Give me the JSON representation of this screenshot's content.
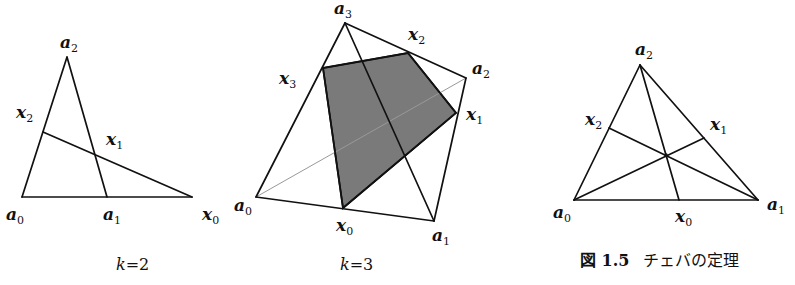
{
  "figure": {
    "number_label": "図 1.5",
    "title": "チェバの定理",
    "panels": [
      {
        "id": "k2",
        "caption_var": "k",
        "caption_eq": "=2",
        "points": {
          "a0": {
            "name": "a",
            "sub": "0"
          },
          "a1": {
            "name": "a",
            "sub": "1"
          },
          "a2": {
            "name": "a",
            "sub": "2"
          },
          "x0": {
            "name": "x",
            "sub": "0"
          },
          "x1": {
            "name": "x",
            "sub": "1"
          },
          "x2": {
            "name": "x",
            "sub": "2"
          }
        }
      },
      {
        "id": "k3",
        "caption_var": "k",
        "caption_eq": "=3",
        "points": {
          "a0": {
            "name": "a",
            "sub": "0"
          },
          "a1": {
            "name": "a",
            "sub": "1"
          },
          "a2": {
            "name": "a",
            "sub": "2"
          },
          "a3": {
            "name": "a",
            "sub": "3"
          },
          "x0": {
            "name": "x",
            "sub": "0"
          },
          "x1": {
            "name": "x",
            "sub": "1"
          },
          "x2": {
            "name": "x",
            "sub": "2"
          },
          "x3": {
            "name": "x",
            "sub": "3"
          }
        },
        "shaded_region_color": "#7a7a7a"
      },
      {
        "id": "ceva",
        "points": {
          "a0": {
            "name": "a",
            "sub": "0"
          },
          "a1": {
            "name": "a",
            "sub": "1"
          },
          "a2": {
            "name": "a",
            "sub": "2"
          },
          "x0": {
            "name": "x",
            "sub": "0"
          },
          "x1": {
            "name": "x",
            "sub": "1"
          },
          "x2": {
            "name": "x",
            "sub": "2"
          }
        }
      }
    ]
  }
}
